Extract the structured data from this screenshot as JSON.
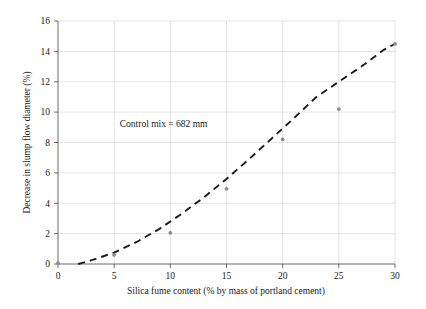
{
  "chart_data": {
    "type": "scatter",
    "title": "",
    "xlabel": "Silica fume content (% by mass of portland cement)",
    "ylabel": "Decrease in slump flow diameter (%)",
    "xlim": [
      0,
      30
    ],
    "ylim": [
      0,
      16
    ],
    "xticks": [
      0,
      5,
      10,
      15,
      20,
      25,
      30
    ],
    "yticks": [
      0,
      2,
      4,
      6,
      8,
      10,
      12,
      14,
      16
    ],
    "xtick_labels": [
      "0",
      "5",
      "10",
      "15",
      "20",
      "25",
      "30"
    ],
    "ytick_labels": [
      "0",
      "2",
      "4",
      "6",
      "8",
      "10",
      "12",
      "14",
      "16"
    ],
    "grid": true,
    "grid_color": "#d9d9d9",
    "legend": "none",
    "marker_color": "#8c8c8c",
    "line_color": "#1a1a1a",
    "line_style": "dashed",
    "x": [
      0,
      5,
      10,
      15,
      20,
      25,
      30
    ],
    "values": [
      0.05,
      0.6,
      2.05,
      4.95,
      8.2,
      10.2,
      14.5
    ],
    "series": [
      {
        "name": "Decrease in slump flow diameter",
        "x": [
          0,
          5,
          10,
          15,
          20,
          25,
          30
        ],
        "values": [
          0.05,
          0.6,
          2.05,
          4.95,
          8.2,
          10.2,
          14.5
        ]
      }
    ],
    "trend_line": {
      "style": "dashed",
      "x_start": 1.8,
      "x_end": 30,
      "points_x": [
        1.8,
        3,
        5,
        7,
        9,
        11,
        13,
        15,
        17,
        19,
        21,
        23,
        25,
        27,
        29,
        30
      ],
      "points_y": [
        0.0,
        0.25,
        0.75,
        1.45,
        2.3,
        3.3,
        4.4,
        5.6,
        6.9,
        8.25,
        9.6,
        11.0,
        12.0,
        13.0,
        14.1,
        14.5
      ]
    },
    "annotations": [
      {
        "text": "Control mix = 682 mm",
        "x": 5.5,
        "y": 9.0
      }
    ]
  }
}
